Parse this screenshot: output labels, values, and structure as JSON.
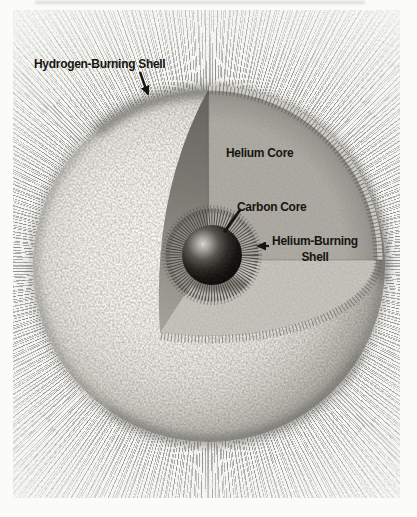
{
  "diagram": {
    "labels": {
      "hydrogen_shell": "Hydrogen-Burning Shell",
      "helium_core": "Helium Core",
      "carbon_core": "Carbon Core",
      "helium_burning_shell_line1": "Helium-Burning",
      "helium_burning_shell_line2": "Shell"
    },
    "colors": {
      "page_background": "#fbfbf8",
      "envelope_highlight": "#f9f8f4",
      "envelope_limb": "#9c9a93",
      "cut_face_shadow": "#676460",
      "helium_core_face": "#adaba4",
      "floor_face": "#c6c4bd",
      "carbon_core": "#121210",
      "corona_rays": "#8a8884",
      "label_text": "#17150f"
    }
  }
}
